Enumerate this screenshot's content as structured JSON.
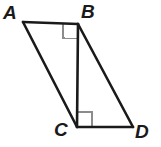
{
  "figure": {
    "kind": "geometry-diagram",
    "background_color": "#ffffff",
    "stroke_color": "#1a1a1a",
    "stroke_width": 2.6,
    "right_angle_marker_color": "#8c8c8c",
    "right_angle_marker_width": 1.2,
    "labels": {
      "a": "A",
      "b": "B",
      "c": "C",
      "d": "D"
    },
    "vertices": {
      "A": {
        "x": 23,
        "y": 22
      },
      "B": {
        "x": 78,
        "y": 24
      },
      "C": {
        "x": 77,
        "y": 127
      },
      "D": {
        "x": 133,
        "y": 127
      }
    },
    "segments": [
      {
        "name": "AB",
        "from": "A",
        "to": "B"
      },
      {
        "name": "AC",
        "from": "A",
        "to": "C"
      },
      {
        "name": "BC",
        "from": "B",
        "to": "C"
      },
      {
        "name": "BD",
        "from": "B",
        "to": "D"
      },
      {
        "name": "CD",
        "from": "C",
        "to": "D"
      }
    ],
    "right_angles": [
      {
        "at": "B",
        "angle": "ABC",
        "size": 15
      },
      {
        "at": "C",
        "angle": "BCD",
        "size": 15
      }
    ]
  }
}
